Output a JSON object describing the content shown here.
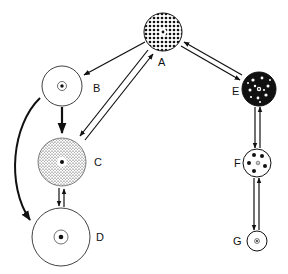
{
  "diagram": {
    "type": "state-transition",
    "nodes": [
      {
        "id": "A",
        "label": "A",
        "pattern": "dense-dots",
        "size": "medium"
      },
      {
        "id": "B",
        "label": "B",
        "pattern": "empty-with-nucleus",
        "size": "medium"
      },
      {
        "id": "C",
        "label": "C",
        "pattern": "fine-stipple",
        "size": "large"
      },
      {
        "id": "D",
        "label": "D",
        "pattern": "empty-with-nucleus",
        "size": "largest"
      },
      {
        "id": "E",
        "label": "E",
        "pattern": "large-blobs",
        "size": "small"
      },
      {
        "id": "F",
        "label": "F",
        "pattern": "five-dots",
        "size": "small"
      },
      {
        "id": "G",
        "label": "G",
        "pattern": "empty-with-nucleus",
        "size": "smallest"
      }
    ],
    "edges": [
      {
        "from": "A",
        "to": "B",
        "kind": "single"
      },
      {
        "from": "B",
        "to": "C",
        "kind": "single-bold"
      },
      {
        "from": "B",
        "to": "D",
        "kind": "curved-bold"
      },
      {
        "from": "A",
        "to": "C",
        "kind": "reversible"
      },
      {
        "from": "C",
        "to": "D",
        "kind": "reversible"
      },
      {
        "from": "A",
        "to": "E",
        "kind": "reversible"
      },
      {
        "from": "E",
        "to": "F",
        "kind": "reversible"
      },
      {
        "from": "F",
        "to": "G",
        "kind": "reversible"
      }
    ]
  }
}
